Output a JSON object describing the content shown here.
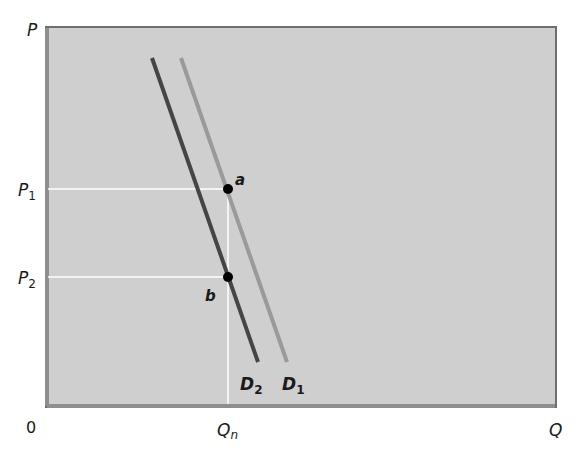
{
  "diagram": {
    "axes": {
      "y_label": "P",
      "x_label": "Q",
      "origin_label": "0"
    },
    "price_levels": [
      {
        "label": "P",
        "sub": "1",
        "y": 189
      },
      {
        "label": "P",
        "sub": "2",
        "y": 277
      }
    ],
    "quantity_level": {
      "label": "Q",
      "sub": "n",
      "x": 228
    },
    "curves": [
      {
        "name": "D",
        "sub": "1",
        "color": "#9a9a9a",
        "x1": 181,
        "y1": 58,
        "x2": 287,
        "y2": 362
      },
      {
        "name": "D",
        "sub": "2",
        "color": "#454545",
        "x1": 152,
        "y1": 58,
        "x2": 258,
        "y2": 362
      }
    ],
    "points": [
      {
        "label": "a",
        "x": 228,
        "y": 189
      },
      {
        "label": "b",
        "x": 228,
        "y": 277
      }
    ],
    "colors": {
      "plot_bg": "#cfcfcf",
      "frame": "#7a7a7a",
      "guide": "#ffffff",
      "point": "#000000"
    }
  }
}
